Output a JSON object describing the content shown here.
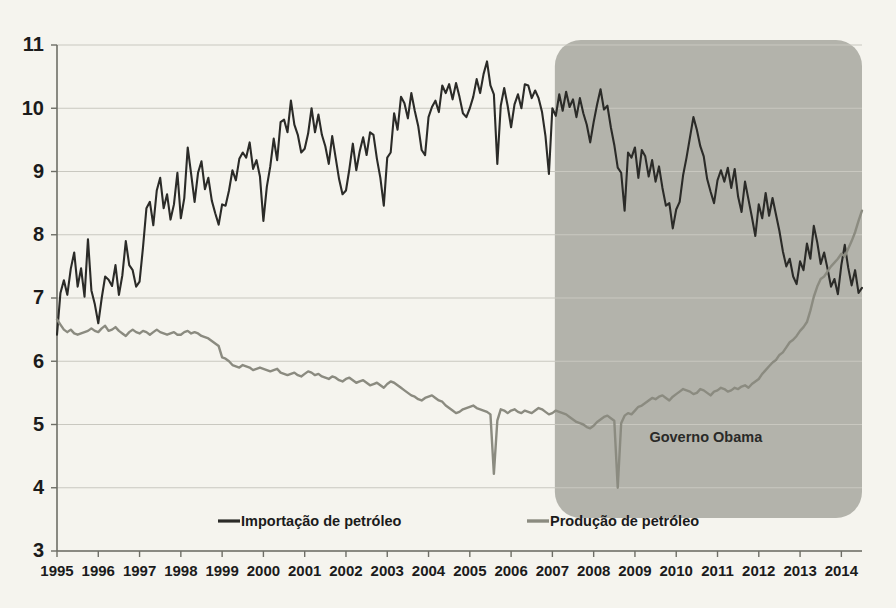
{
  "chart_data": {
    "type": "line",
    "title": "",
    "xlabel": "",
    "ylabel": "",
    "xlim": [
      1995.0,
      2014.5
    ],
    "ylim": [
      3,
      11
    ],
    "y_ticks": [
      3,
      4,
      5,
      6,
      7,
      8,
      9,
      10,
      11
    ],
    "x_ticks": [
      1995,
      1996,
      1997,
      1998,
      1999,
      2000,
      2001,
      2002,
      2003,
      2004,
      2005,
      2006,
      2007,
      2008,
      2009,
      2010,
      2011,
      2012,
      2013,
      2014
    ],
    "grid": true,
    "legend_position": "bottom",
    "annotations": [
      {
        "text": "Governo Obama",
        "x": 2009.35,
        "y": 4.78
      }
    ],
    "shaded_regions": [
      {
        "label": "Governo Obama",
        "x_start": 2007.06,
        "x_end": 2014.5,
        "color": "#b3b3ab"
      }
    ],
    "series": [
      {
        "name": "Importação de petróleo",
        "color": "#2b2b28",
        "x_start": 1995.0,
        "x_step": 0.08333,
        "values": [
          6.42,
          7.08,
          7.28,
          7.05,
          7.46,
          7.72,
          7.18,
          7.47,
          7.02,
          7.93,
          7.12,
          6.9,
          6.6,
          7.0,
          7.34,
          7.29,
          7.19,
          7.52,
          7.05,
          7.36,
          7.9,
          7.52,
          7.44,
          7.18,
          7.26,
          7.8,
          8.42,
          8.52,
          8.15,
          8.7,
          8.9,
          8.42,
          8.64,
          8.24,
          8.48,
          8.98,
          8.26,
          8.58,
          9.38,
          8.96,
          8.52,
          8.98,
          9.16,
          8.72,
          8.9,
          8.54,
          8.34,
          8.16,
          8.48,
          8.46,
          8.7,
          9.02,
          8.86,
          9.2,
          9.3,
          9.22,
          9.46,
          9.04,
          9.18,
          8.92,
          8.22,
          8.76,
          9.08,
          9.52,
          9.18,
          9.78,
          9.82,
          9.62,
          10.12,
          9.74,
          9.58,
          9.3,
          9.36,
          9.6,
          10.0,
          9.62,
          9.9,
          9.58,
          9.4,
          9.12,
          9.56,
          9.22,
          8.88,
          8.64,
          8.7,
          9.04,
          9.44,
          9.02,
          9.32,
          9.54,
          9.26,
          9.62,
          9.58,
          9.2,
          8.9,
          8.46,
          9.22,
          9.3,
          9.92,
          9.66,
          10.18,
          10.08,
          9.84,
          10.24,
          9.96,
          9.72,
          9.34,
          9.26,
          9.86,
          10.02,
          10.12,
          9.94,
          10.36,
          10.24,
          10.38,
          10.14,
          10.4,
          10.18,
          9.92,
          9.86,
          10.0,
          10.18,
          10.46,
          10.24,
          10.54,
          10.74,
          10.36,
          10.22,
          9.12,
          10.04,
          10.32,
          10.04,
          9.7,
          10.06,
          10.22,
          10.0,
          10.38,
          10.36,
          10.16,
          10.28,
          10.16,
          9.94,
          9.56,
          8.96,
          10.0,
          9.88,
          10.22,
          9.96,
          10.26,
          10.02,
          10.14,
          9.86,
          10.16,
          9.92,
          9.74,
          9.46,
          9.78,
          10.06,
          10.3,
          9.98,
          10.04,
          9.7,
          9.42,
          9.06,
          8.98,
          8.38,
          9.3,
          9.22,
          9.38,
          8.9,
          9.34,
          9.24,
          8.92,
          9.18,
          8.84,
          9.08,
          8.74,
          8.46,
          8.5,
          8.1,
          8.4,
          8.52,
          8.94,
          9.22,
          9.54,
          9.86,
          9.66,
          9.4,
          9.24,
          8.88,
          8.68,
          8.5,
          8.86,
          9.02,
          8.84,
          9.06,
          8.74,
          9.04,
          8.6,
          8.36,
          8.84,
          8.56,
          8.28,
          7.98,
          8.48,
          8.26,
          8.66,
          8.3,
          8.58,
          8.32,
          8.06,
          7.74,
          7.5,
          7.62,
          7.34,
          7.22,
          7.58,
          7.44,
          7.86,
          7.62,
          8.14,
          7.88,
          7.54,
          7.72,
          7.46,
          7.18,
          7.3,
          7.06,
          7.52,
          7.84,
          7.48,
          7.2,
          7.44,
          7.08,
          7.16
        ]
      },
      {
        "name": "Produção de petróleo",
        "color": "#8b8b80",
        "x_start": 1995.0,
        "x_step": 0.08333,
        "values": [
          6.66,
          6.58,
          6.5,
          6.46,
          6.5,
          6.44,
          6.42,
          6.44,
          6.46,
          6.48,
          6.52,
          6.48,
          6.46,
          6.52,
          6.56,
          6.48,
          6.5,
          6.54,
          6.48,
          6.44,
          6.4,
          6.46,
          6.5,
          6.46,
          6.44,
          6.48,
          6.46,
          6.42,
          6.46,
          6.5,
          6.46,
          6.44,
          6.42,
          6.44,
          6.46,
          6.42,
          6.42,
          6.46,
          6.48,
          6.44,
          6.46,
          6.44,
          6.4,
          6.38,
          6.36,
          6.32,
          6.28,
          6.24,
          6.06,
          6.04,
          6.0,
          5.94,
          5.92,
          5.9,
          5.94,
          5.92,
          5.9,
          5.86,
          5.88,
          5.9,
          5.88,
          5.86,
          5.84,
          5.86,
          5.88,
          5.82,
          5.8,
          5.78,
          5.8,
          5.82,
          5.78,
          5.76,
          5.8,
          5.84,
          5.82,
          5.78,
          5.8,
          5.76,
          5.74,
          5.72,
          5.76,
          5.74,
          5.7,
          5.68,
          5.72,
          5.74,
          5.7,
          5.66,
          5.68,
          5.7,
          5.66,
          5.62,
          5.64,
          5.66,
          5.62,
          5.58,
          5.64,
          5.68,
          5.66,
          5.62,
          5.58,
          5.54,
          5.5,
          5.46,
          5.44,
          5.4,
          5.38,
          5.42,
          5.44,
          5.46,
          5.42,
          5.38,
          5.36,
          5.3,
          5.26,
          5.22,
          5.18,
          5.2,
          5.24,
          5.26,
          5.28,
          5.3,
          5.26,
          5.24,
          5.22,
          5.2,
          5.16,
          4.22,
          5.06,
          5.24,
          5.22,
          5.18,
          5.22,
          5.24,
          5.2,
          5.18,
          5.22,
          5.2,
          5.18,
          5.22,
          5.26,
          5.24,
          5.2,
          5.16,
          5.18,
          5.22,
          5.2,
          5.18,
          5.16,
          5.12,
          5.08,
          5.04,
          5.02,
          5.0,
          4.96,
          4.94,
          4.98,
          5.04,
          5.08,
          5.12,
          5.14,
          5.1,
          5.06,
          4.0,
          5.02,
          5.14,
          5.18,
          5.16,
          5.22,
          5.28,
          5.3,
          5.34,
          5.38,
          5.42,
          5.4,
          5.44,
          5.46,
          5.42,
          5.38,
          5.44,
          5.48,
          5.52,
          5.56,
          5.54,
          5.52,
          5.48,
          5.5,
          5.56,
          5.54,
          5.5,
          5.46,
          5.52,
          5.54,
          5.58,
          5.56,
          5.52,
          5.54,
          5.58,
          5.56,
          5.6,
          5.62,
          5.58,
          5.64,
          5.68,
          5.72,
          5.8,
          5.86,
          5.92,
          5.98,
          6.02,
          6.1,
          6.14,
          6.22,
          6.3,
          6.34,
          6.4,
          6.48,
          6.54,
          6.62,
          6.8,
          7.02,
          7.18,
          7.3,
          7.34,
          7.42,
          7.5,
          7.56,
          7.62,
          7.7,
          7.66,
          7.78,
          7.9,
          8.04,
          8.22,
          8.38
        ]
      }
    ]
  },
  "legend": {
    "items": [
      {
        "label": "Importação de petróleo",
        "color": "#2b2b28"
      },
      {
        "label": "Produção de petróleo",
        "color": "#8b8b80"
      }
    ]
  },
  "axes": {
    "y_tick_labels": [
      "11",
      "10",
      "9",
      "8",
      "7",
      "6",
      "5",
      "4",
      "3"
    ],
    "x_tick_labels": [
      "1995",
      "1996",
      "1997",
      "1998",
      "1999",
      "2000",
      "2001",
      "2002",
      "2003",
      "2004",
      "2005",
      "2006",
      "2007",
      "2008",
      "2009",
      "2010",
      "2011",
      "2012",
      "2013",
      "2014"
    ]
  },
  "annotation": {
    "governo_obama": "Governo Obama"
  }
}
